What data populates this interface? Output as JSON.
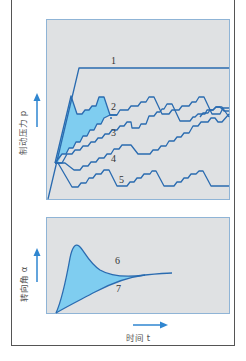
{
  "diagram": {
    "top_panel": {
      "y_axis_label": "制动压力 p",
      "curve_labels": [
        "1",
        "2",
        "3",
        "4",
        "5"
      ]
    },
    "bottom_panel": {
      "y_axis_label": "转向角 α",
      "curve_labels": [
        "6",
        "7"
      ]
    },
    "x_axis_label": "时间 t",
    "colors": {
      "panel_bg": "#dfe1e3",
      "panel_border": "#8fb4d6",
      "line": "#2a6bb0",
      "fill": "#7fcdf0",
      "arrow": "#2f86d0",
      "frame": "#555555"
    }
  }
}
